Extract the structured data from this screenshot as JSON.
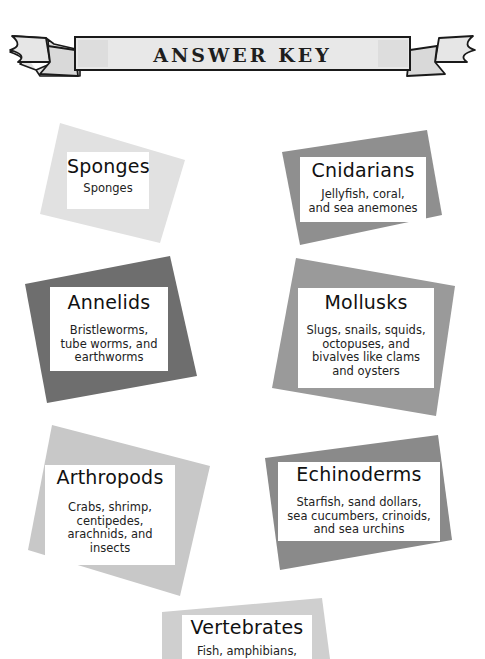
{
  "header": {
    "title": "ANSWER KEY",
    "banner_fill": "#e6e6e6",
    "banner_outline": "#1a1a1a"
  },
  "cards": [
    {
      "title": "Sponges",
      "description": "Sponges",
      "shape_color": "#e1e1e1"
    },
    {
      "title": "Cnidarians",
      "description": "Jellyfish, coral,\nand sea anemones",
      "shape_color": "#8f8f8f"
    },
    {
      "title": "Annelids",
      "description": "Bristleworms,\ntube worms, and\nearthworms",
      "shape_color": "#6e6e6e"
    },
    {
      "title": "Mollusks",
      "description": "Slugs, snails, squids,\noctopuses, and\nbivalves like clams\nand oysters",
      "shape_color": "#9a9a9a"
    },
    {
      "title": "Arthropods",
      "description": "Crabs, shrimp,\ncentipedes,\narachnids, and\ninsects",
      "shape_color": "#c8c8c8"
    },
    {
      "title": "Echinoderms",
      "description": "Starfish, sand dollars,\nsea cucumbers, crinoids,\nand sea urchins",
      "shape_color": "#8a8a8a"
    },
    {
      "title": "Vertebrates",
      "description": "Fish, amphibians,",
      "shape_color": "#cfcfcf"
    }
  ]
}
